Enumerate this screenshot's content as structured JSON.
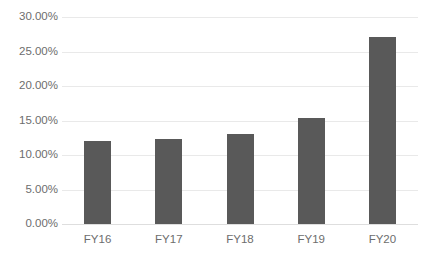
{
  "chart_data": {
    "type": "bar",
    "title": "",
    "subtitle": "",
    "xlabel": "",
    "ylabel": "",
    "categories": [
      "FY16",
      "FY17",
      "FY18",
      "FY19",
      "FY20"
    ],
    "values": [
      12.0,
      12.3,
      13.0,
      15.4,
      27.1
    ],
    "value_format": "percent",
    "ylim": [
      0,
      30
    ],
    "ytick_values": [
      30,
      25,
      20,
      15,
      10,
      5,
      0
    ],
    "ytick_labels": [
      "30.00%",
      "25.00%",
      "20.00%",
      "15.00%",
      "10.00%",
      "5.00%",
      "0.00%"
    ],
    "grid": true,
    "grid_axis": "y",
    "legend": false,
    "legend_position": "none",
    "series": [
      {
        "name": "",
        "values": [
          12.0,
          12.3,
          13.0,
          15.4,
          27.1
        ]
      }
    ],
    "colors": {
      "bar": "#595959",
      "gridline": "#e9e9e9",
      "baseline": "#dedede",
      "tick_label": "#6d6d6d",
      "background": "#ffffff"
    }
  }
}
